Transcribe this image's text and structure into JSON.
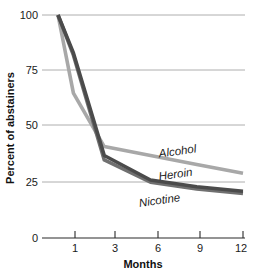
{
  "chart_data": {
    "type": "line",
    "title": "",
    "subtitle": "",
    "xlabel": "Months",
    "ylabel": "Percent of abstainers",
    "x": [
      0,
      1,
      3,
      6,
      9,
      12
    ],
    "xtick_values": [
      1,
      3,
      6,
      9,
      12
    ],
    "xtick_labels": [
      "1",
      "3",
      "6",
      "9",
      "12"
    ],
    "ytick_values": [
      0,
      25,
      50,
      75,
      100
    ],
    "ytick_labels": [
      "0",
      "25",
      "50",
      "75",
      "100"
    ],
    "xlim": [
      0,
      12
    ],
    "ylim": [
      0,
      100
    ],
    "grid": "horizontal",
    "legend": "inline-end-labels",
    "series": [
      {
        "name": "Alcohol",
        "color": "#a8a8a8",
        "values": [
          100,
          65,
          41,
          37,
          33,
          29
        ],
        "label_x": 9.0,
        "label_y": 41
      },
      {
        "name": "Heroin",
        "color": "#4b4b4b",
        "values": [
          100,
          83,
          37,
          26,
          23,
          21
        ],
        "label_x": 8.6,
        "label_y": 30
      },
      {
        "name": "Nicotine",
        "color": "#707070",
        "values": [
          100,
          82,
          35,
          25,
          22,
          20
        ],
        "label_x": 7.2,
        "label_y": 19
      }
    ]
  },
  "axes": {
    "y_axis_title": "Percent of abstainers",
    "x_axis_title": "Months",
    "y_labels": [
      "100",
      "75",
      "50",
      "25",
      "0"
    ],
    "x_labels": [
      "1",
      "3",
      "6",
      "9",
      "12"
    ]
  },
  "series_labels": {
    "alcohol": "Alcohol",
    "heroin": "Heroin",
    "nicotine": "Nicotine"
  }
}
